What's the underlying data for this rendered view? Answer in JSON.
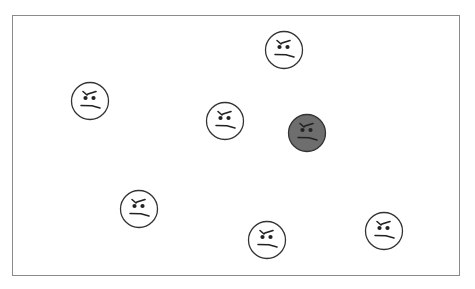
{
  "scene": {
    "description": "Canvas with grumpy face icons; one face is highlighted in dark gray",
    "frame_color": "#8a8a8a",
    "background": "#ffffff"
  },
  "faces": [
    {
      "id": "face-1",
      "cx": 283,
      "cy": 49,
      "fill": "#ffffff",
      "selected": false,
      "expression": "grumpy"
    },
    {
      "id": "face-2",
      "cx": 89,
      "cy": 100,
      "fill": "#ffffff",
      "selected": false,
      "expression": "grumpy"
    },
    {
      "id": "face-3",
      "cx": 224,
      "cy": 120,
      "fill": "#ffffff",
      "selected": false,
      "expression": "grumpy"
    },
    {
      "id": "face-4",
      "cx": 306,
      "cy": 132,
      "fill": "#6e6e6e",
      "selected": true,
      "expression": "grumpy"
    },
    {
      "id": "face-5",
      "cx": 138,
      "cy": 208,
      "fill": "#ffffff",
      "selected": false,
      "expression": "grumpy"
    },
    {
      "id": "face-6",
      "cx": 266,
      "cy": 239,
      "fill": "#ffffff",
      "selected": false,
      "expression": "grumpy"
    },
    {
      "id": "face-7",
      "cx": 383,
      "cy": 230,
      "fill": "#ffffff",
      "selected": false,
      "expression": "grumpy"
    }
  ],
  "colors": {
    "outline": "#333333",
    "features": "#222222",
    "highlight_fill": "#6e6e6e"
  }
}
